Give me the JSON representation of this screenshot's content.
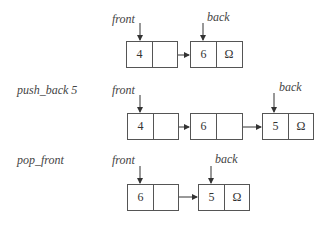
{
  "diagram": {
    "rows": [
      {
        "operation": "",
        "front_label": "front",
        "back_label": "back",
        "nodes": [
          {
            "value": "4",
            "next": ""
          },
          {
            "value": "6",
            "next": "Ω"
          }
        ]
      },
      {
        "operation": "push_back 5",
        "front_label": "front",
        "back_label": "back",
        "nodes": [
          {
            "value": "4",
            "next": ""
          },
          {
            "value": "6",
            "next": ""
          },
          {
            "value": "5",
            "next": "Ω"
          }
        ]
      },
      {
        "operation": "pop_front",
        "front_label": "front",
        "back_label": "back",
        "nodes": [
          {
            "value": "6",
            "next": ""
          },
          {
            "value": "5",
            "next": "Ω"
          }
        ]
      }
    ]
  }
}
